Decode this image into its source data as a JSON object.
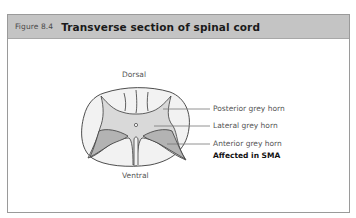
{
  "figure": {
    "number": "Figure 8.4",
    "title": "Transverse section of spinal cord"
  },
  "diagram": {
    "orientation_top": "Dorsal",
    "orientation_bottom": "Ventral",
    "labels": [
      {
        "text": "Posterior grey horn"
      },
      {
        "text": "Lateral grey horn"
      },
      {
        "text": "Anterior grey horn"
      }
    ],
    "note": "Affected in SMA",
    "colors": {
      "header_bg": "#c4c4c4",
      "white_matter": "#f2f2f2",
      "grey_matter": "#d9d9d9",
      "anterior_horn": "#b3b3b3",
      "outline": "#3a3a3a",
      "leader_line": "#777777"
    }
  }
}
